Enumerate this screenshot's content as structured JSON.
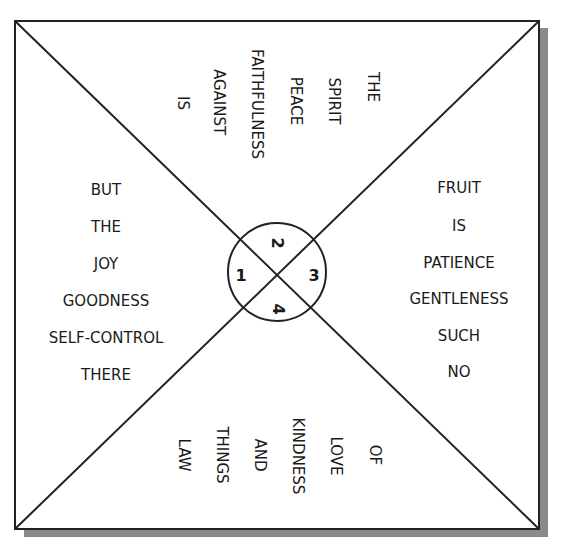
{
  "diagram": {
    "type": "square-quadrant-word-puzzle",
    "colors": {
      "line": "#222222",
      "shadow": "#8a8a8a",
      "background": "#ffffff",
      "text": "#1a1a1a"
    },
    "center_numbers": [
      "1",
      "2",
      "3",
      "4"
    ],
    "quadrants": {
      "top": {
        "orientation": "rotated-90-clockwise",
        "words": [
          "THE",
          "SPIRIT",
          "PEACE",
          "FAITHFULNESS",
          "AGAINST",
          "IS"
        ]
      },
      "right": {
        "orientation": "horizontal",
        "words": [
          "FRUIT",
          "IS",
          "PATIENCE",
          "GENTLENESS",
          "SUCH",
          "NO"
        ]
      },
      "bottom": {
        "orientation": "rotated-90-clockwise",
        "words": [
          "OF",
          "LOVE",
          "KINDNESS",
          "AND",
          "THINGS",
          "LAW"
        ]
      },
      "left": {
        "orientation": "horizontal",
        "words": [
          "BUT",
          "THE",
          "JOY",
          "GOODNESS",
          "SELF-CONTROL",
          "THERE"
        ]
      }
    }
  }
}
